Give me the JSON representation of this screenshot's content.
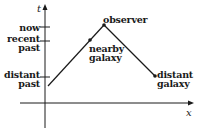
{
  "diagram": {
    "type": "spacetime-diagram",
    "axes": {
      "vertical_label": "t",
      "horizontal_label": "x"
    },
    "time_ticks": [
      {
        "label": "now"
      },
      {
        "label_line1": "recent",
        "label_line2": "past"
      },
      {
        "label_line1": "distant",
        "label_line2": "past"
      }
    ],
    "points": {
      "observer": {
        "label": "observer"
      },
      "nearby_galaxy": {
        "label_line1": "nearby",
        "label_line2": "galaxy"
      },
      "distant_galaxy": {
        "label_line1": "distant",
        "label_line2": "galaxy"
      }
    },
    "colors": {
      "ink": "#1a1a1a",
      "background": "#ffffff"
    }
  }
}
